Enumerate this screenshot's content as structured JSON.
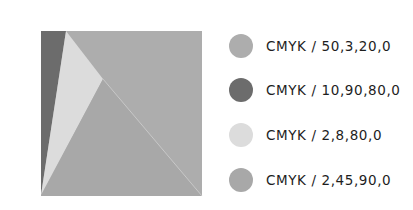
{
  "composition": {
    "shapes": [
      {
        "name": "background-square",
        "color": "#adadad",
        "points": "41,31 202,31 202,196 41,196"
      },
      {
        "name": "dark-strip",
        "color": "#6c6c6c",
        "points": "41,31 66,31 41,195"
      },
      {
        "name": "light-triangle",
        "color": "#dcdcdc",
        "points": "66,31 103,79 41,195"
      },
      {
        "name": "bottom-triangle",
        "color": "#a8a8a8",
        "points": "41,196 103,79 202,196"
      }
    ],
    "edge_color": "#c8c8c8"
  },
  "legend": {
    "items": [
      {
        "label": "CMYK / 50,3,20,0",
        "color": "#adadad"
      },
      {
        "label": "CMYK / 10,90,80,0",
        "color": "#6c6c6c"
      },
      {
        "label": "CMYK / 2,8,80,0",
        "color": "#dcdcdc"
      },
      {
        "label": "CMYK / 2,45,90,0",
        "color": "#a8a8a8"
      }
    ]
  }
}
